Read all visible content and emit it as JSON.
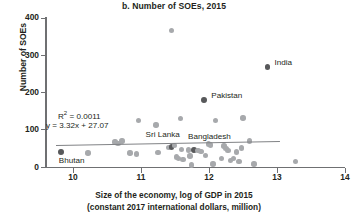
{
  "chart_data": {
    "type": "scatter",
    "title": "b. Number of SOEs, 2015",
    "xlabel_line1": "Size of the economy, log of GDP in 2015",
    "xlabel_line2": "(constant 2017 international dollars, million)",
    "ylabel": "Number of SOEs",
    "xlim": [
      9.6,
      14
    ],
    "ylim": [
      0,
      400
    ],
    "xticks": [
      10,
      11,
      12,
      13,
      14
    ],
    "yticks": [
      0,
      100,
      200,
      300,
      400
    ],
    "grid": false,
    "legend": "none",
    "annotations": {
      "r_squared_label": "R",
      "r_squared_sup": "2",
      "r_squared_value": " = 0.0011",
      "equation": "y = 3.32x + 27.07"
    },
    "trendline": {
      "slope": 3.32,
      "intercept": 27.07,
      "x_start": 9.75,
      "x_end": 13.05,
      "color": "#808285"
    },
    "colors": {
      "point_default": "#a7a9ac",
      "point_highlight": "#58595b",
      "axis": "#6f7072",
      "text": "#231f20"
    },
    "labeled_points": [
      {
        "name": "Bhutan",
        "x": 9.82,
        "y": 40,
        "label_dx": -2,
        "label_dy": 9,
        "align": "left"
      },
      {
        "name": "Sri Lanka",
        "x": 11.45,
        "y": 55,
        "label_dx": -26,
        "label_dy": -12,
        "align": "left"
      },
      {
        "name": "Bangladesh",
        "x": 11.78,
        "y": 47,
        "label_dx": -6,
        "label_dy": -13,
        "align": "left"
      },
      {
        "name": "Pakistan",
        "x": 11.93,
        "y": 181,
        "label_dx": 7,
        "label_dy": -4,
        "align": "left"
      },
      {
        "name": "India",
        "x": 12.86,
        "y": 268,
        "label_dx": 7,
        "label_dy": -4,
        "align": "left"
      }
    ],
    "points": [
      {
        "x": 9.82,
        "y": 40
      },
      {
        "x": 10.22,
        "y": 38
      },
      {
        "x": 10.62,
        "y": 68
      },
      {
        "x": 10.66,
        "y": 64
      },
      {
        "x": 10.72,
        "y": 70
      },
      {
        "x": 10.84,
        "y": 38
      },
      {
        "x": 10.93,
        "y": 35
      },
      {
        "x": 10.96,
        "y": 125
      },
      {
        "x": 11.22,
        "y": 113
      },
      {
        "x": 11.25,
        "y": 39
      },
      {
        "x": 11.4,
        "y": 52
      },
      {
        "x": 11.45,
        "y": 367
      },
      {
        "x": 11.45,
        "y": 55
      },
      {
        "x": 11.49,
        "y": 58
      },
      {
        "x": 11.52,
        "y": 27
      },
      {
        "x": 11.55,
        "y": 24
      },
      {
        "x": 11.58,
        "y": 131
      },
      {
        "x": 11.6,
        "y": 48
      },
      {
        "x": 11.62,
        "y": 20
      },
      {
        "x": 11.7,
        "y": 46
      },
      {
        "x": 11.72,
        "y": 30
      },
      {
        "x": 11.74,
        "y": 6
      },
      {
        "x": 11.78,
        "y": 47
      },
      {
        "x": 11.84,
        "y": 44
      },
      {
        "x": 11.88,
        "y": 42
      },
      {
        "x": 11.93,
        "y": 181
      },
      {
        "x": 11.95,
        "y": 31
      },
      {
        "x": 11.99,
        "y": 62
      },
      {
        "x": 12.02,
        "y": 60
      },
      {
        "x": 12.06,
        "y": 9
      },
      {
        "x": 12.1,
        "y": 125
      },
      {
        "x": 12.18,
        "y": 24
      },
      {
        "x": 12.22,
        "y": 57
      },
      {
        "x": 12.25,
        "y": 50
      },
      {
        "x": 12.28,
        "y": 44
      },
      {
        "x": 12.32,
        "y": 18
      },
      {
        "x": 12.36,
        "y": 23
      },
      {
        "x": 12.4,
        "y": 41
      },
      {
        "x": 12.44,
        "y": 16
      },
      {
        "x": 12.48,
        "y": 51
      },
      {
        "x": 12.5,
        "y": 132
      },
      {
        "x": 12.6,
        "y": 70
      },
      {
        "x": 12.66,
        "y": 9
      },
      {
        "x": 12.86,
        "y": 268
      },
      {
        "x": 13.27,
        "y": 16
      }
    ]
  }
}
